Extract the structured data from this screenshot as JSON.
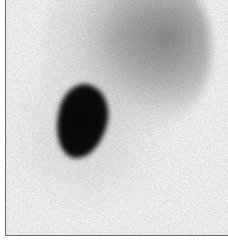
{
  "figure": {
    "type": "scintigraphy-scan",
    "colors": {
      "background": "#f7f7f7",
      "hotspot": "#050505",
      "organ_mid": "#787878",
      "frame_border": "#6b6b6b"
    }
  },
  "caption": {
    "text": ""
  }
}
